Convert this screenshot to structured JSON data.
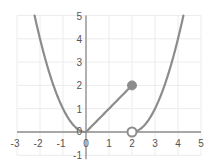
{
  "chart_data": {
    "type": "line",
    "title": "",
    "xlabel": "",
    "ylabel": "",
    "xlim": [
      -3,
      5
    ],
    "ylim": [
      -1,
      5
    ],
    "grid": true,
    "legend": null,
    "x_ticks": [
      -3,
      -2,
      -1,
      0,
      1,
      2,
      3,
      4,
      5
    ],
    "y_ticks": [
      -1,
      0,
      1,
      2,
      3,
      4,
      5
    ],
    "series": [
      {
        "name": "piece-left",
        "function": "y = x^2",
        "domain": [
          -2.236,
          0
        ],
        "points": [
          [
            -2.236,
            5
          ],
          [
            -2,
            4
          ],
          [
            -1,
            1
          ],
          [
            0,
            0
          ]
        ]
      },
      {
        "name": "piece-middle",
        "function": "y = x",
        "domain": [
          0,
          2
        ],
        "points": [
          [
            0,
            0
          ],
          [
            2,
            2
          ]
        ]
      },
      {
        "name": "piece-right",
        "function": "y = (x-2)^2",
        "domain": [
          2,
          4.236
        ],
        "points": [
          [
            2,
            0
          ],
          [
            3,
            1
          ],
          [
            4,
            4
          ],
          [
            4.236,
            5
          ]
        ]
      }
    ],
    "markers": [
      {
        "x": 2,
        "y": 2,
        "style": "filled"
      },
      {
        "x": 2,
        "y": 0,
        "style": "open"
      }
    ]
  },
  "colors": {
    "curve": "#8c8c8c",
    "axis": "#8c8c8c",
    "grid": "#ececec",
    "label": "#555555",
    "marker_fill": "#8c8c8c",
    "marker_open_fill": "#ffffff"
  }
}
